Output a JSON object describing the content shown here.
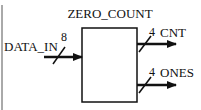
{
  "diagram": {
    "block": {
      "name": "ZERO_COUNT"
    },
    "inputs": [
      {
        "label": "DATA_IN",
        "width": "8"
      }
    ],
    "outputs": [
      {
        "label": "CNT",
        "width": "4"
      },
      {
        "label": "ONES",
        "width": "4"
      }
    ],
    "colors": {
      "line": "#111111",
      "background": "#ffffff"
    }
  }
}
